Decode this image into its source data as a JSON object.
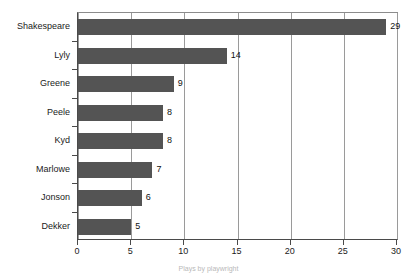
{
  "chart_data": {
    "type": "bar",
    "orientation": "horizontal",
    "title": "",
    "xlabel": "",
    "ylabel": "",
    "categories": [
      "Shakespeare",
      "Lyly",
      "Greene",
      "Peele",
      "Kyd",
      "Marlowe",
      "Jonson",
      "Dekker"
    ],
    "values": [
      29,
      14,
      9,
      8,
      8,
      7,
      6,
      5
    ],
    "value_labels": [
      "29",
      "14",
      "9",
      "8",
      "8",
      "7",
      "6",
      "5"
    ],
    "xlim": [
      0,
      30
    ],
    "xticks": [
      0,
      5,
      10,
      15,
      20,
      25,
      30
    ],
    "xtick_labels": [
      "0",
      "5",
      "10",
      "15",
      "20",
      "25",
      "30"
    ],
    "grid": "vertical",
    "legend": null,
    "bar_color": "#545454",
    "axis_color": "#4a4a4a",
    "grid_color": "#9a9a9a",
    "background": "#ffffff"
  },
  "caption": {
    "text": "Plays by playwright"
  }
}
